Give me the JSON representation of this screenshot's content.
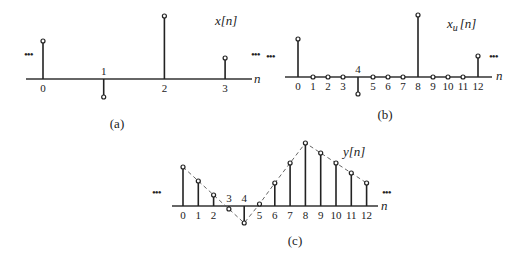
{
  "panels": [
    {
      "id": "a",
      "caption": "(a)",
      "signal_label": "x[n]",
      "axis_label": "n",
      "ellipsis": "•••",
      "axis": {
        "x0": 26,
        "x1": 252,
        "y": 79
      },
      "n0_x": 43,
      "dx": 60.7,
      "samples": [
        {
          "n": 0,
          "label": "0",
          "top": 41
        },
        {
          "n": 1,
          "label": "1",
          "top": 97
        },
        {
          "n": 2,
          "label": "2",
          "top": 16
        },
        {
          "n": 3,
          "label": "3",
          "top": 58
        }
      ]
    },
    {
      "id": "b",
      "caption": "(b)",
      "signal_label": "x_u[n]",
      "signal_label_main": "x",
      "signal_label_sub": "u",
      "signal_label_arg": "[n]",
      "axis_label": "n",
      "ellipsis": "•••",
      "axis": {
        "x0": 285,
        "x1": 492,
        "y": 77
      },
      "n0_x": 298,
      "dx": 15,
      "samples": [
        {
          "n": 0,
          "label": "0",
          "top": 39
        },
        {
          "n": 1,
          "label": "1",
          "top": 77
        },
        {
          "n": 2,
          "label": "2",
          "top": 77
        },
        {
          "n": 3,
          "label": "3",
          "top": 77
        },
        {
          "n": 4,
          "label": "4",
          "top": 94
        },
        {
          "n": 5,
          "label": "5",
          "top": 77
        },
        {
          "n": 6,
          "label": "6",
          "top": 77
        },
        {
          "n": 7,
          "label": "7",
          "top": 77
        },
        {
          "n": 8,
          "label": "8",
          "top": 15
        },
        {
          "n": 9,
          "label": "9",
          "top": 77
        },
        {
          "n": 10,
          "label": "10",
          "top": 77
        },
        {
          "n": 11,
          "label": "11",
          "top": 77
        },
        {
          "n": 12,
          "label": "12",
          "top": 56
        }
      ]
    },
    {
      "id": "c",
      "caption": "(c)",
      "signal_label": "y[n]",
      "axis_label": "n",
      "ellipsis": "•••",
      "axis": {
        "x0": 172,
        "x1": 378,
        "y": 206
      },
      "n0_x": 183,
      "dx": 15.3,
      "samples": [
        {
          "n": 0,
          "label": "0",
          "top": 167
        },
        {
          "n": 1,
          "label": "1",
          "top": 181
        },
        {
          "n": 2,
          "label": "2",
          "top": 195
        },
        {
          "n": 3,
          "label": "3",
          "top": 209
        },
        {
          "n": 4,
          "label": "4",
          "top": 223
        },
        {
          "n": 5,
          "label": "5",
          "top": 204
        },
        {
          "n": 6,
          "label": "6",
          "top": 183
        },
        {
          "n": 7,
          "label": "7",
          "top": 163
        },
        {
          "n": 8,
          "label": "8",
          "top": 143
        },
        {
          "n": 9,
          "label": "9",
          "top": 153
        },
        {
          "n": 10,
          "label": "10",
          "top": 163
        },
        {
          "n": 11,
          "label": "11",
          "top": 173
        },
        {
          "n": 12,
          "label": "12",
          "top": 183
        }
      ]
    }
  ],
  "chart_data": [
    {
      "type": "stem",
      "title": "x[n]",
      "xlabel": "n",
      "x": [
        0,
        1,
        2,
        3
      ],
      "values": [
        1.0,
        -0.5,
        1.65,
        0.55
      ],
      "caption": "(a)"
    },
    {
      "type": "stem",
      "title": "x_u[n]",
      "xlabel": "n",
      "x": [
        0,
        1,
        2,
        3,
        4,
        5,
        6,
        7,
        8,
        9,
        10,
        11,
        12
      ],
      "values": [
        1.0,
        0,
        0,
        0,
        -0.45,
        0,
        0,
        0,
        1.65,
        0,
        0,
        0,
        0.55
      ],
      "caption": "(b)"
    },
    {
      "type": "stem",
      "title": "y[n]",
      "xlabel": "n",
      "x": [
        0,
        1,
        2,
        3,
        4,
        5,
        6,
        7,
        8,
        9,
        10,
        11,
        12
      ],
      "values": [
        1.0,
        0.65,
        0.3,
        -0.1,
        -0.45,
        0.05,
        0.6,
        1.1,
        1.65,
        1.35,
        1.1,
        0.85,
        0.55
      ],
      "interpolation": "dashed linear envelope",
      "caption": "(c)"
    }
  ]
}
